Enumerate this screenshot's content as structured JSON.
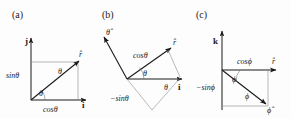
{
  "figure": {
    "caption_type": "three-panel vector decomposition diagram",
    "background_color": "#fdfdfd",
    "ink_color": "#1a1a1a",
    "thin_color": "#8a8a8a"
  },
  "panels": [
    {
      "id": "a",
      "label": "(a)",
      "axes": [
        {
          "name": "j-axis",
          "label": "j",
          "direction": "up"
        },
        {
          "name": "i-axis",
          "label": "i",
          "direction": "right"
        }
      ],
      "vectors": [
        {
          "name": "r-hat",
          "label": "r̂",
          "label_plain": "r-hat"
        }
      ],
      "components": [
        {
          "name": "sin-component",
          "label": "sinθ",
          "position": "left"
        },
        {
          "name": "cos-component",
          "label": "cosθ",
          "position": "bottom"
        }
      ],
      "angles": [
        {
          "name": "angle-at-origin",
          "label": "θ"
        },
        {
          "name": "angle-upper",
          "label": "θ"
        }
      ]
    },
    {
      "id": "b",
      "label": "(b)",
      "axes": [
        {
          "name": "i-axis",
          "label": "i",
          "direction": "right"
        }
      ],
      "vectors": [
        {
          "name": "r-hat",
          "label": "r̂",
          "label_plain": "r-hat"
        },
        {
          "name": "theta-hat",
          "label": "θ̂",
          "label_plain": "theta-hat"
        }
      ],
      "components": [
        {
          "name": "cos-component",
          "label": "cosθ",
          "position": "upper"
        },
        {
          "name": "neg-sin-component",
          "label": "−sinθ",
          "position": "lower-left"
        }
      ],
      "angles": [
        {
          "name": "angle-at-origin",
          "label": "θ"
        },
        {
          "name": "angle-right",
          "label": "θ"
        }
      ]
    },
    {
      "id": "c",
      "label": "(c)",
      "axes": [
        {
          "name": "k-axis",
          "label": "k",
          "direction": "up"
        }
      ],
      "vectors": [
        {
          "name": "r-hat",
          "label": "r̂",
          "label_plain": "r-hat"
        },
        {
          "name": "phi-hat",
          "label": "ϕ̂",
          "label_plain": "phi-hat"
        }
      ],
      "components": [
        {
          "name": "cos-component",
          "label": "cosϕ",
          "position": "upper"
        },
        {
          "name": "neg-sin-component",
          "label": "−sinϕ",
          "position": "left"
        }
      ],
      "angles": [
        {
          "name": "angle-at-origin",
          "label": "ϕ"
        },
        {
          "name": "angle-lower",
          "label": "ϕ"
        }
      ]
    }
  ]
}
